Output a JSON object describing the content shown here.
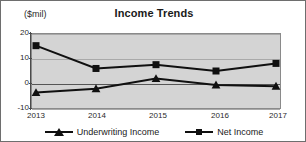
{
  "chart_data": {
    "type": "line",
    "title": "Income Trends",
    "xlabel": "",
    "ylabel": "($mil)",
    "categories": [
      "2013",
      "2014",
      "2015",
      "2016",
      "2017"
    ],
    "ylim": [
      -10,
      20
    ],
    "yticks": [
      20,
      10,
      0,
      -10
    ],
    "ytick_labels": [
      "20",
      "10",
      "0",
      "-10"
    ],
    "grid": true,
    "legend_position": "bottom",
    "series": [
      {
        "name": "Underwriting Income",
        "marker": "triangle",
        "color": "#101010",
        "values": [
          -3.5,
          -2,
          2,
          -0.5,
          -1
        ]
      },
      {
        "name": "Net Income",
        "marker": "square",
        "color": "#101010",
        "values": [
          15,
          6,
          7.5,
          5,
          8
        ]
      }
    ]
  },
  "colors": {
    "plot_background": "#d4d4d4",
    "frame_border": "#6e6e6e",
    "gridline": "#a9a9a9",
    "zeroline": "#555555",
    "series_ink": "#101010"
  }
}
